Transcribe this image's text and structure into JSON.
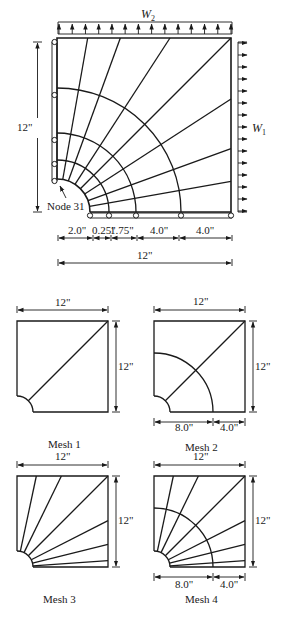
{
  "main_figure": {
    "loads": {
      "top": {
        "symbol": "W",
        "subscript": "2"
      },
      "right": {
        "symbol": "W",
        "subscript": "1"
      }
    },
    "vertical_dimension": "12\"",
    "node_label": "Node 31",
    "bottom_dimensions": [
      "2.0\"",
      "0.25\"",
      "1.75\"",
      "4.0\"",
      "4.0\""
    ],
    "overall_dimension": "12\""
  },
  "meshes": [
    {
      "caption": "Mesh 1",
      "top_dim": "12\"",
      "side_dim": "12\""
    },
    {
      "caption": "Mesh 2",
      "top_dim": "12\"",
      "side_dim": "12\"",
      "bottom_dims": [
        "8.0\"",
        "4.0\""
      ]
    },
    {
      "caption": "Mesh 3",
      "top_dim": "12\"",
      "side_dim": "12\""
    },
    {
      "caption": "Mesh 4",
      "top_dim": "12\"",
      "side_dim": "12\"",
      "bottom_dims": [
        "8.0\"",
        "4.0\""
      ]
    }
  ],
  "colors": {
    "ink": "#1a1a1a",
    "background": "#ffffff"
  }
}
